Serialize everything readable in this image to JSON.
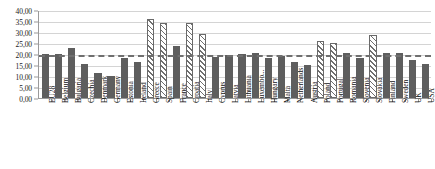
{
  "chart_data": {
    "type": "bar",
    "title": "",
    "subtitle": "",
    "xlabel": "",
    "ylabel": "",
    "ylim": [
      0,
      40
    ],
    "ytick_labels": [
      "0,00",
      "5,00",
      "10,00",
      "15,00",
      "20,00",
      "25,00",
      "30,00",
      "35,00",
      "40,00"
    ],
    "ytick_values": [
      0,
      5,
      10,
      15,
      20,
      25,
      30,
      35,
      40
    ],
    "grid": true,
    "legend": "none",
    "reference_line": {
      "value": 20.0,
      "style": "dashed",
      "color": "#6f6f6f"
    },
    "categories": [
      "EU28",
      "Belgium",
      "Bulgaria",
      "Czechia",
      "Denmark",
      "Germany",
      "Estonia",
      "Ireland",
      "Greece",
      "Spain",
      "France",
      "Croatia",
      "Italy",
      "Cyprus",
      "Latvia",
      "Lithuania",
      "Luxembo...",
      "Hungary",
      "Malta",
      "Netherlands",
      "Austria",
      "Poland",
      "Portugal",
      "Romania",
      "Slovenia",
      "Slovakia",
      "Finland",
      "Sweden",
      "UK",
      "USA"
    ],
    "values": [
      19.8,
      19.8,
      22.7,
      15.5,
      11.3,
      10.2,
      18.4,
      16.4,
      36.0,
      34.0,
      23.8,
      34.2,
      29.0,
      18.6,
      19.5,
      20.2,
      20.5,
      18.0,
      19.0,
      16.2,
      15.2,
      25.8,
      25.0,
      20.5,
      18.0,
      28.5,
      20.5,
      20.4,
      17.4,
      15.4
    ],
    "highlighted_categories": [
      "Greece",
      "Spain",
      "Croatia",
      "Italy",
      "Poland",
      "Portugal",
      "Slovakia"
    ],
    "series_styles": {
      "default": {
        "fill": "#5e5e5e",
        "pattern": "solid"
      },
      "highlight": {
        "fill": "#ffffff",
        "pattern": "diagonal-hatch",
        "stroke": "#6a6a6a"
      }
    }
  }
}
